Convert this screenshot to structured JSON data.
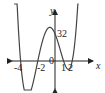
{
  "chart_data": {
    "type": "line",
    "title": "",
    "function": "f(x) = 2(x+4)(x+2)(x-1)(x-2)",
    "xlabel": "x",
    "ylabel": "y",
    "x_ticks": [
      "-4",
      "-2",
      "0",
      "1",
      "2"
    ],
    "y_ticks": [
      "32"
    ],
    "x_intercepts": [
      -4,
      -2,
      1,
      2
    ],
    "y_intercept": 32,
    "xlim": [
      -5,
      3
    ],
    "grid": false
  },
  "labels": {
    "y_axis": "y",
    "x_axis": "x",
    "y32": "32",
    "xm4": "-4",
    "xm2": "-2",
    "x0": "0",
    "x1": "1",
    "x2": "2"
  },
  "colors": {
    "curve": "#444444",
    "axis": "#222222"
  }
}
